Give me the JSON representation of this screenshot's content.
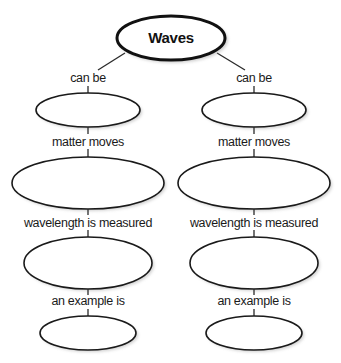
{
  "diagram": {
    "type": "concept-map",
    "root": {
      "label": "Waves"
    },
    "branches": [
      {
        "side": "left",
        "links": [
          "can be",
          "matter moves",
          "wavelength is measured",
          "an example is"
        ],
        "nodes": [
          "",
          "",
          "",
          ""
        ]
      },
      {
        "side": "right",
        "links": [
          "can be",
          "matter moves",
          "wavelength is measured",
          "an example is"
        ],
        "nodes": [
          "",
          "",
          "",
          ""
        ]
      }
    ]
  },
  "colors": {
    "stroke": "#1a1a1a",
    "fill": "#ffffff",
    "background": "#ffffff"
  }
}
